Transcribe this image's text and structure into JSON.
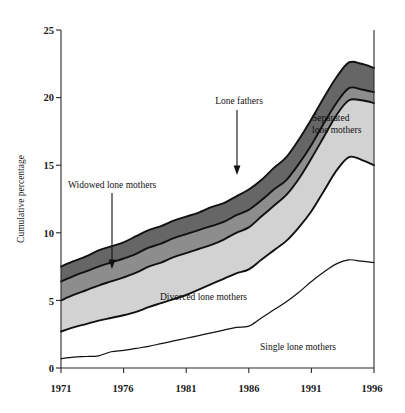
{
  "chart_data": {
    "type": "area",
    "title": "",
    "subtitle": "",
    "xlabel": "",
    "ylabel": "Cumulative percentage",
    "stacked": true,
    "grid": false,
    "legend_position": "inline-annotations",
    "xlim": [
      1971,
      1996
    ],
    "ylim": [
      0,
      25
    ],
    "xticks": [
      "1971",
      "1976",
      "1981",
      "1986",
      "1991",
      "1996"
    ],
    "xtick_values": [
      1971,
      1976,
      1981,
      1986,
      1991,
      1996
    ],
    "yticks": [
      "0",
      "5",
      "10",
      "15",
      "20",
      "25"
    ],
    "ytick_values": [
      0,
      5,
      10,
      15,
      20,
      25
    ],
    "x": [
      1971,
      1972,
      1973,
      1974,
      1975,
      1976,
      1977,
      1978,
      1979,
      1980,
      1981,
      1982,
      1983,
      1984,
      1985,
      1986,
      1987,
      1988,
      1989,
      1990,
      1991,
      1992,
      1993,
      1994,
      1995,
      1996
    ],
    "series": [
      {
        "name": "Single lone mothers",
        "color": "#ffffff",
        "values": [
          0.7,
          0.8,
          0.85,
          0.9,
          1.2,
          1.3,
          1.45,
          1.6,
          1.8,
          2.0,
          2.2,
          2.4,
          2.6,
          2.8,
          3.0,
          3.1,
          3.7,
          4.3,
          4.9,
          5.6,
          6.4,
          7.1,
          7.7,
          8.0,
          7.9,
          7.8
        ]
      },
      {
        "name": "Divorced lone mothers",
        "color": "#ffffff",
        "values": [
          2.0,
          2.2,
          2.4,
          2.6,
          2.5,
          2.6,
          2.7,
          2.9,
          3.0,
          3.1,
          3.2,
          3.4,
          3.6,
          3.8,
          4.0,
          4.2,
          4.3,
          4.4,
          4.5,
          4.8,
          5.2,
          6.0,
          6.9,
          7.6,
          7.5,
          7.2
        ]
      },
      {
        "name": "Separated lone mothers",
        "color": "#d2d2d2",
        "values": [
          2.3,
          2.4,
          2.5,
          2.6,
          2.7,
          2.8,
          2.9,
          3.0,
          3.0,
          3.1,
          3.1,
          3.0,
          2.9,
          2.9,
          3.0,
          3.1,
          3.2,
          3.3,
          3.4,
          3.6,
          3.9,
          4.0,
          4.1,
          4.2,
          4.4,
          4.6
        ]
      },
      {
        "name": "Widowed lone mothers",
        "color": "#8d8d8d",
        "values": [
          1.4,
          1.4,
          1.4,
          1.4,
          1.4,
          1.4,
          1.4,
          1.4,
          1.4,
          1.4,
          1.4,
          1.4,
          1.4,
          1.3,
          1.3,
          1.3,
          1.2,
          1.2,
          1.1,
          1.1,
          1.0,
          1.0,
          0.9,
          0.9,
          0.8,
          0.8
        ]
      },
      {
        "name": "Lone fathers",
        "color": "#666666",
        "values": [
          1.1,
          1.1,
          1.1,
          1.2,
          1.2,
          1.2,
          1.3,
          1.3,
          1.3,
          1.3,
          1.3,
          1.3,
          1.4,
          1.4,
          1.4,
          1.5,
          1.5,
          1.6,
          1.7,
          1.8,
          1.9,
          1.9,
          1.9,
          1.9,
          1.9,
          1.8
        ]
      }
    ],
    "cumulative_boundaries": {
      "single_top": [
        0.7,
        0.8,
        0.85,
        0.9,
        1.2,
        1.3,
        1.45,
        1.6,
        1.8,
        2.0,
        2.2,
        2.4,
        2.6,
        2.8,
        3.0,
        3.1,
        3.7,
        4.3,
        4.9,
        5.6,
        6.4,
        7.1,
        7.7,
        8.0,
        7.9,
        7.8
      ],
      "divorced_top": [
        2.7,
        3.0,
        3.25,
        3.5,
        3.7,
        3.9,
        4.15,
        4.5,
        4.8,
        5.1,
        5.4,
        5.8,
        6.2,
        6.6,
        7.0,
        7.3,
        8.0,
        8.7,
        9.4,
        10.4,
        11.6,
        13.1,
        14.6,
        15.6,
        15.4,
        15.0
      ],
      "separated_top": [
        5.0,
        5.4,
        5.75,
        6.1,
        6.4,
        6.7,
        7.05,
        7.5,
        7.8,
        8.2,
        8.5,
        8.8,
        9.1,
        9.5,
        10.0,
        10.4,
        11.2,
        12.0,
        12.8,
        14.0,
        15.5,
        17.1,
        18.7,
        19.8,
        19.8,
        19.6
      ],
      "widowed_top": [
        6.4,
        6.8,
        7.15,
        7.5,
        7.8,
        8.1,
        8.45,
        8.9,
        9.2,
        9.6,
        9.9,
        10.2,
        10.5,
        10.8,
        11.3,
        11.7,
        12.4,
        13.2,
        13.9,
        15.1,
        16.5,
        18.1,
        19.6,
        20.7,
        20.6,
        20.4
      ],
      "fathers_top": [
        7.5,
        7.9,
        8.25,
        8.7,
        9.0,
        9.3,
        9.75,
        10.2,
        10.5,
        10.9,
        11.2,
        11.5,
        11.9,
        12.2,
        12.7,
        13.2,
        13.9,
        14.8,
        15.6,
        16.9,
        18.4,
        20.0,
        21.5,
        22.6,
        22.5,
        22.2
      ]
    },
    "annotations": [
      {
        "id": "widowed",
        "label": "Widowed lone mothers",
        "arrow": "down"
      },
      {
        "id": "fathers",
        "label": "Lone fathers",
        "arrow": "down"
      },
      {
        "id": "separated",
        "label_line1": "Separated",
        "label_line2": "lone mothers",
        "arrow": "none"
      },
      {
        "id": "divorced",
        "label": "Divorced lone mothers",
        "arrow": "none"
      },
      {
        "id": "single",
        "label": "Single lone mothers",
        "arrow": "none"
      }
    ],
    "colors": {
      "lone_fathers": "#666666",
      "widowed": "#8d8d8d",
      "separated": "#d2d2d2",
      "divorced": "#ffffff",
      "single": "#ffffff",
      "axis": "#2b2b2b",
      "line": "#111111",
      "background": "#ffffff"
    }
  },
  "axis": {
    "y_title": "Cumulative percentage",
    "y_ticks": [
      "25",
      "20",
      "15",
      "10",
      "5",
      "0"
    ],
    "x_ticks": [
      "1971",
      "1976",
      "1981",
      "1986",
      "1991",
      "1996"
    ]
  },
  "labels": {
    "widowed": "Widowed lone mothers",
    "lone_fathers": "Lone fathers",
    "separated_line1": "Separated",
    "separated_line2": "lone mothers",
    "divorced": "Divorced lone mothers",
    "single": "Single lone mothers"
  }
}
